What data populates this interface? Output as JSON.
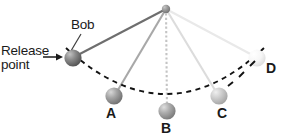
{
  "figure": {
    "width": 281,
    "height": 138,
    "background": "#ffffff"
  },
  "labels": {
    "release_line1": "Release",
    "release_line2": "point",
    "bob": "Bob",
    "position_a": "A",
    "position_b": "B",
    "position_c": "C",
    "position_d": "D"
  },
  "colors": {
    "text": "#1a1a1a",
    "arc_dash": "#131313",
    "string_bob": "#6e6e6e",
    "string_a": "#a8a8a8",
    "string_b": "#c9c9c9",
    "string_c": "#dcdcdc",
    "string_d": "#e8e8e8",
    "bob_ball_dark": "#6b6b6b",
    "ball_a": "#8f8f8f",
    "ball_b": "#9d9d9d",
    "ball_c": "#bfbfbf",
    "ball_d": "#f1f1f1",
    "pivot": "#8a8a8a",
    "leader_line": "#4a4a4a"
  },
  "geometry": {
    "pivot": {
      "x": 166,
      "y": 9,
      "r": 4
    },
    "balls": [
      {
        "id": "bob",
        "x": 73,
        "y": 58,
        "r": 8.5
      },
      {
        "id": "A",
        "x": 114,
        "y": 96,
        "r": 8.5
      },
      {
        "id": "B",
        "x": 167,
        "y": 111,
        "r": 8.5
      },
      {
        "id": "C",
        "x": 219,
        "y": 96,
        "r": 8.5
      },
      {
        "id": "D",
        "x": 257,
        "y": 58,
        "r": 8.5
      }
    ],
    "arc": "M 66 48 Q 167 139 264 48",
    "release_arrow": {
      "from_x": 44,
      "from_y": 57,
      "to_x": 62,
      "to_y": 57
    },
    "bob_leader": {
      "from_x": 80,
      "from_y": 35,
      "to_x": 71,
      "to_y": 50
    }
  }
}
